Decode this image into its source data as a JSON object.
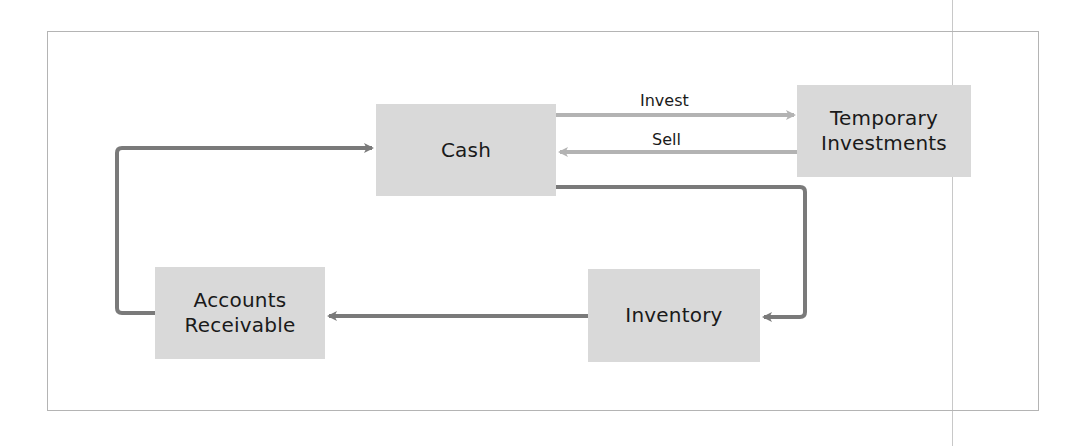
{
  "diagram": {
    "nodes": {
      "cash": {
        "lines": [
          "Cash"
        ]
      },
      "temporary_investments": {
        "lines": [
          "Temporary",
          "Investments"
        ]
      },
      "accounts_receivable": {
        "lines": [
          "Accounts",
          "Receivable"
        ]
      },
      "inventory": {
        "lines": [
          "Inventory"
        ]
      }
    },
    "edges": {
      "invest": {
        "label": "Invest",
        "from": "Cash",
        "to": "Temporary Investments"
      },
      "sell": {
        "label": "Sell",
        "from": "Temporary Investments",
        "to": "Cash"
      },
      "cash_to_inventory": {
        "label": "",
        "from": "Cash",
        "to": "Inventory"
      },
      "inventory_to_receivables": {
        "label": "",
        "from": "Inventory",
        "to": "Accounts Receivable"
      },
      "receivables_to_cash": {
        "label": "",
        "from": "Accounts Receivable",
        "to": "Cash"
      }
    },
    "colors": {
      "node_fill": "#d9d9d9",
      "cycle_arrow": "#7a7a7a",
      "investment_arrow": "#b3b3b3",
      "frame_border": "#b4b4b4"
    }
  }
}
